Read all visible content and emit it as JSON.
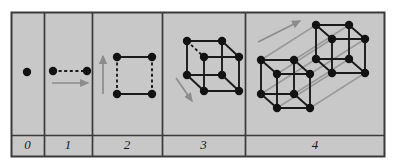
{
  "figure": {
    "caption": "",
    "type": "dimensional-construction-diagram",
    "panel_count": 5,
    "background_color": "#c8c8c8",
    "page_color": "#ffffff",
    "border_color": "#3a3a3a",
    "node_color": "#121212",
    "edge_color": "#1a1a1a",
    "dashed_edge_color": "#1a1a1a",
    "arrow_color": "#8c8c8c",
    "translation_line_color": "#9a9a9a",
    "label_color": "#1a1a1a",
    "frame": {
      "x": 11,
      "y": 12,
      "width": 374,
      "height": 145
    },
    "label_row": {
      "y": 135,
      "height": 22
    },
    "dividers": [
      44,
      92,
      162,
      245
    ],
    "node_radius": 4.2,
    "edge_width": 1.9,
    "arrow_width": 1.7
  },
  "panels": [
    {
      "id": "panel-0",
      "label": "0",
      "name": "dimension-0-point",
      "x": 11,
      "width": 33,
      "label_center_x": 27.5,
      "nodes": [
        [
          27,
          72
        ]
      ],
      "solid_edges": [],
      "dashed_edges": [],
      "translation_edges": [],
      "arrows": []
    },
    {
      "id": "panel-1",
      "label": "1",
      "name": "dimension-1-line",
      "x": 44,
      "width": 48,
      "label_center_x": 68,
      "nodes": [
        [
          53,
          71
        ],
        [
          87,
          71
        ]
      ],
      "solid_edges": [],
      "dashed_edges": [
        [
          53,
          71,
          87,
          71
        ]
      ],
      "translation_edges": [],
      "arrows": [
        [
          52,
          83,
          88,
          83
        ]
      ]
    },
    {
      "id": "panel-2",
      "label": "2",
      "name": "dimension-2-square",
      "x": 92,
      "width": 70,
      "label_center_x": 127,
      "nodes": [
        [
          117,
          57
        ],
        [
          152,
          57
        ],
        [
          117,
          94
        ],
        [
          152,
          94
        ]
      ],
      "solid_edges": [
        [
          117,
          57,
          152,
          57
        ],
        [
          117,
          94,
          152,
          94
        ]
      ],
      "dashed_edges": [
        [
          117,
          57,
          117,
          94
        ],
        [
          152,
          57,
          152,
          94
        ]
      ],
      "translation_edges": [],
      "arrows": [
        [
          103,
          94,
          103,
          56
        ]
      ]
    },
    {
      "id": "panel-3",
      "label": "3",
      "name": "dimension-3-cube",
      "x": 162,
      "width": 83,
      "label_center_x": 203.5,
      "nodes": [
        [
          187,
          41
        ],
        [
          222,
          41
        ],
        [
          187,
          75
        ],
        [
          222,
          75
        ],
        [
          204,
          57
        ],
        [
          239,
          57
        ],
        [
          204,
          91
        ],
        [
          239,
          91
        ]
      ],
      "solid_edges": [
        [
          187,
          41,
          222,
          41
        ],
        [
          187,
          41,
          187,
          75
        ],
        [
          187,
          75,
          222,
          75
        ],
        [
          222,
          41,
          222,
          75
        ],
        [
          204,
          57,
          239,
          57
        ],
        [
          204,
          57,
          204,
          91
        ],
        [
          204,
          91,
          239,
          91
        ],
        [
          239,
          57,
          239,
          91
        ],
        [
          222,
          41,
          239,
          57
        ],
        [
          222,
          75,
          239,
          91
        ],
        [
          187,
          75,
          204,
          91
        ]
      ],
      "dashed_edges": [
        [
          187,
          41,
          204,
          57
        ]
      ],
      "translation_edges": [],
      "arrows": [
        [
          176,
          78,
          192,
          101
        ]
      ]
    },
    {
      "id": "panel-4",
      "label": "4",
      "name": "dimension-4-tesseract",
      "x": 245,
      "width": 140,
      "label_center_x": 315,
      "nodes": [
        [
          261,
          60
        ],
        [
          294,
          60
        ],
        [
          261,
          94
        ],
        [
          294,
          94
        ],
        [
          277,
          74
        ],
        [
          310,
          74
        ],
        [
          277,
          108
        ],
        [
          310,
          108
        ],
        [
          316,
          25
        ],
        [
          349,
          25
        ],
        [
          316,
          59
        ],
        [
          349,
          59
        ],
        [
          332,
          39
        ],
        [
          365,
          39
        ],
        [
          332,
          73
        ],
        [
          365,
          73
        ]
      ],
      "solid_edges": [
        [
          261,
          60,
          294,
          60
        ],
        [
          261,
          60,
          261,
          94
        ],
        [
          261,
          94,
          294,
          94
        ],
        [
          294,
          60,
          294,
          94
        ],
        [
          277,
          74,
          310,
          74
        ],
        [
          277,
          74,
          277,
          108
        ],
        [
          277,
          108,
          310,
          108
        ],
        [
          310,
          74,
          310,
          108
        ],
        [
          261,
          60,
          277,
          74
        ],
        [
          294,
          60,
          310,
          74
        ],
        [
          261,
          94,
          277,
          108
        ],
        [
          294,
          94,
          310,
          108
        ],
        [
          316,
          25,
          349,
          25
        ],
        [
          316,
          25,
          316,
          59
        ],
        [
          316,
          59,
          349,
          59
        ],
        [
          349,
          25,
          349,
          59
        ],
        [
          332,
          39,
          365,
          39
        ],
        [
          332,
          39,
          332,
          73
        ],
        [
          332,
          73,
          365,
          73
        ],
        [
          365,
          39,
          365,
          73
        ],
        [
          316,
          25,
          332,
          39
        ],
        [
          349,
          25,
          365,
          39
        ],
        [
          316,
          59,
          332,
          73
        ],
        [
          349,
          59,
          365,
          73
        ]
      ],
      "dashed_edges": [],
      "translation_edges": [
        [
          261,
          60,
          316,
          25
        ],
        [
          294,
          60,
          349,
          25
        ],
        [
          261,
          94,
          316,
          59
        ],
        [
          294,
          94,
          349,
          59
        ],
        [
          277,
          74,
          332,
          39
        ],
        [
          310,
          74,
          365,
          39
        ],
        [
          277,
          108,
          332,
          73
        ],
        [
          310,
          108,
          365,
          73
        ]
      ],
      "arrows": [
        [
          258,
          42,
          300,
          21
        ]
      ]
    }
  ]
}
